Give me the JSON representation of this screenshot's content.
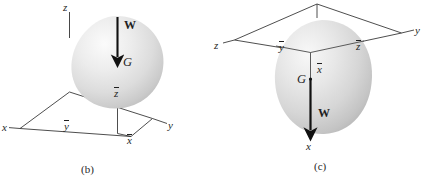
{
  "figure": {
    "title_visible": false,
    "panels": [
      {
        "id": "b",
        "caption": "(b)",
        "description": "Rigid body with weight W acting downward through center of gravity G, z-axis vertical",
        "axes": [
          {
            "name": "x-axis-label",
            "label": "x",
            "overbar": false
          },
          {
            "name": "y-axis-label",
            "label": "y",
            "overbar": false
          },
          {
            "name": "z-axis-label",
            "label": "z",
            "overbar": false
          }
        ],
        "centroid_labels": [
          {
            "name": "x-bar-label",
            "label": "x",
            "overbar": true
          },
          {
            "name": "y-bar-label",
            "label": "y",
            "overbar": true
          },
          {
            "name": "z-bar-label",
            "label": "z",
            "overbar": true
          }
        ],
        "force_label": "W",
        "point_label": "G"
      },
      {
        "id": "c",
        "caption": "(c)",
        "description": "Same rigid body re-oriented with x-axis vertical downward, weight W acting along x direction",
        "axes": [
          {
            "name": "x-axis-label",
            "label": "x",
            "overbar": false
          },
          {
            "name": "y-axis-label",
            "label": "y",
            "overbar": false
          },
          {
            "name": "z-axis-label",
            "label": "z",
            "overbar": false
          }
        ],
        "centroid_labels": [
          {
            "name": "x-bar-label",
            "label": "x",
            "overbar": true
          },
          {
            "name": "y-bar-label",
            "label": "y",
            "overbar": true
          },
          {
            "name": "z-bar-label",
            "label": "z",
            "overbar": true
          }
        ],
        "force_label": "W",
        "point_label": "G"
      }
    ],
    "colors": {
      "line": "#1f1f1f",
      "body_light": "#f2f2f2",
      "body_mid": "#d8d8d8",
      "body_dark": "#b9b9b9",
      "background": "#ffffff"
    }
  }
}
